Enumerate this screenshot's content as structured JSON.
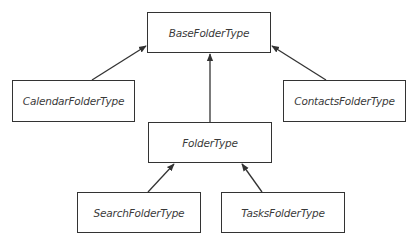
{
  "diagram": {
    "type": "class-inheritance",
    "nodes": [
      {
        "id": "base",
        "label": "BaseFolderType",
        "x": 147,
        "y": 12,
        "w": 124,
        "h": 41
      },
      {
        "id": "calendar",
        "label": "CalendarFolderType",
        "x": 12,
        "y": 80,
        "w": 123,
        "h": 42
      },
      {
        "id": "contacts",
        "label": "ContactsFolderType",
        "x": 283,
        "y": 80,
        "w": 123,
        "h": 42
      },
      {
        "id": "folder",
        "label": "FolderType",
        "x": 148,
        "y": 122,
        "w": 124,
        "h": 41
      },
      {
        "id": "search",
        "label": "SearchFolderType",
        "x": 77,
        "y": 192,
        "w": 124,
        "h": 41
      },
      {
        "id": "tasks",
        "label": "TasksFolderType",
        "x": 221,
        "y": 192,
        "w": 124,
        "h": 41
      }
    ],
    "edges": [
      {
        "from": "calendar",
        "to": "base"
      },
      {
        "from": "contacts",
        "to": "base"
      },
      {
        "from": "folder",
        "to": "base"
      },
      {
        "from": "search",
        "to": "folder"
      },
      {
        "from": "tasks",
        "to": "folder"
      }
    ],
    "colors": {
      "stroke": "#333333",
      "text": "#3a3a3a",
      "background": "#ffffff"
    }
  }
}
